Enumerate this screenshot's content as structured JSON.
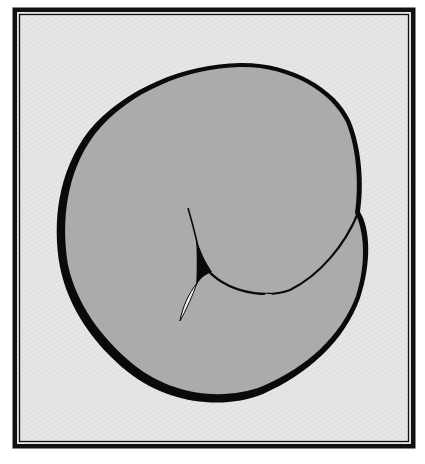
{
  "figure": {
    "colors": {
      "page": "#ffffff",
      "frame": "#111111",
      "background": "#e4e4e4",
      "blob_fill": "#ababab",
      "outline": "#0a0a0a",
      "highlight": "#f2f2f2"
    },
    "frame": {
      "outer": {
        "x": 12,
        "y": 7,
        "width": 404,
        "height": 442,
        "stroke": 5
      },
      "inner": {
        "x": 19,
        "y": 14,
        "width": 390,
        "height": 428,
        "stroke": 1.2
      }
    }
  }
}
